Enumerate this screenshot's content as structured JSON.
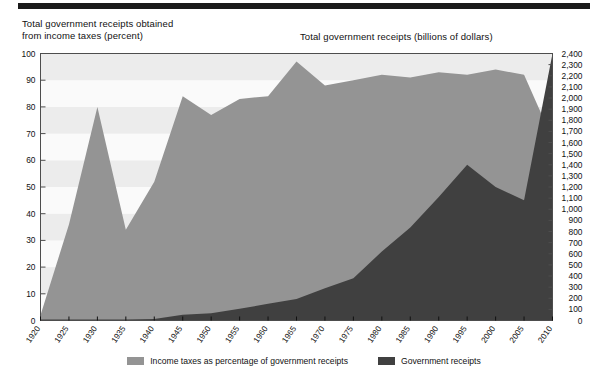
{
  "decor": {
    "top_rule_color": "#1a1a1a"
  },
  "titles": {
    "left_axis": "Total government receipts obtained\nfrom income taxes (percent)",
    "right_axis": "Total government receipts (billions of dollars)"
  },
  "colors": {
    "series_light": "#949494",
    "series_dark": "#404040",
    "band_light": "#fafafa",
    "band_shade": "#ececec",
    "axis": "#4d4d4d",
    "text": "#111111"
  },
  "legend": {
    "items": [
      {
        "label": "Income taxes as percentage of government receipts",
        "color": "#949494"
      },
      {
        "label": "Government receipts",
        "color": "#404040"
      }
    ]
  },
  "chart_data": {
    "type": "area",
    "title": "",
    "subtitle": "",
    "xlabel": "",
    "ylabel": "Total government receipts obtained from income taxes (percent)",
    "y2label": "Total government receipts (billions of dollars)",
    "grid": true,
    "legend_position": "bottom",
    "x": [
      1920,
      1925,
      1930,
      1935,
      1940,
      1945,
      1950,
      1955,
      1960,
      1965,
      1970,
      1975,
      1980,
      1985,
      1990,
      1995,
      2000,
      2005,
      2010
    ],
    "xlim": [
      1920,
      2010
    ],
    "xticks": [
      1920,
      1925,
      1930,
      1935,
      1940,
      1945,
      1950,
      1955,
      1960,
      1965,
      1970,
      1975,
      1980,
      1985,
      1990,
      1995,
      2000,
      2005,
      2010
    ],
    "xtick_labels": [
      "1920",
      "1925",
      "1930",
      "1935",
      "1940",
      "1945",
      "1950",
      "1955",
      "1960",
      "1965",
      "1970",
      "1975",
      "1980",
      "1985",
      "1990",
      "1995",
      "2000",
      "2005",
      "2010"
    ],
    "ylim": [
      0,
      100
    ],
    "yticks": [
      0,
      10,
      20,
      30,
      40,
      50,
      60,
      70,
      80,
      90,
      100
    ],
    "ytick_labels": [
      "0",
      "10",
      "20",
      "30",
      "40",
      "50",
      "60",
      "70",
      "80",
      "90",
      "100"
    ],
    "y2lim": [
      0,
      2400
    ],
    "y2ticks": [
      0,
      100,
      200,
      300,
      400,
      500,
      600,
      700,
      800,
      900,
      1000,
      1100,
      1200,
      1300,
      1400,
      1500,
      1600,
      1700,
      1800,
      1900,
      2000,
      2100,
      2200,
      2300,
      2400
    ],
    "y2tick_labels": [
      "0",
      "100",
      "200",
      "300",
      "400",
      "500",
      "600",
      "700",
      "800",
      "900",
      "1,000",
      "1,100",
      "1,200",
      "1,300",
      "1,400",
      "1,500",
      "1,600",
      "1,700",
      "1,800",
      "1,900",
      "2,000",
      "2,100",
      "2,200",
      "2,300",
      "2,400"
    ],
    "series": [
      {
        "name": "Income taxes as percentage of government receipts",
        "axis": "left",
        "units": "percent",
        "color": "#949494",
        "values": [
          2,
          36,
          80,
          34,
          52,
          84,
          77,
          83,
          84,
          97,
          88,
          90,
          92,
          91,
          93,
          92,
          94,
          92,
          68
        ]
      },
      {
        "name": "Government receipts",
        "axis": "right",
        "units": "billions of dollars",
        "color": "#404040",
        "values": [
          8,
          8,
          10,
          10,
          14,
          52,
          66,
          106,
          150,
          193,
          290,
          380,
          620,
          835,
          1110,
          1400,
          1200,
          1080,
          2400
        ]
      }
    ]
  }
}
